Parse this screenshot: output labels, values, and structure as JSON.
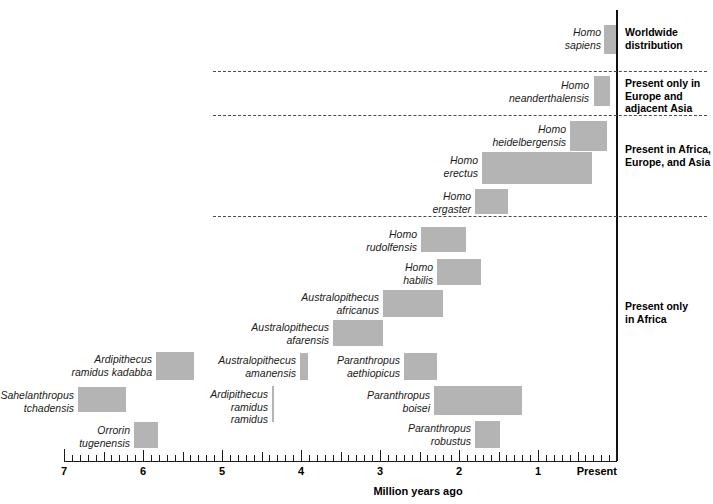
{
  "chart_data": {
    "type": "bar",
    "orientation": "horizontal",
    "title": "",
    "xlabel": "Million years ago",
    "ylabel": "",
    "xlim": [
      7,
      0
    ],
    "x_tick_values": [
      7,
      6,
      5,
      4,
      3,
      2,
      1,
      0
    ],
    "x_tick_labels": [
      "7",
      "6",
      "5",
      "4",
      "3",
      "2",
      "1",
      "Present"
    ],
    "minor_tick_interval": 0.1,
    "grid": false,
    "legend": "none",
    "units": "million years ago",
    "note": "Temporal ranges of hominin species; bar spans give first and last appearance dates in millions of years ago.",
    "categories": [
      "Homo sapiens",
      "Homo neanderthalensis",
      "Homo heidelbergensis",
      "Homo erectus",
      "Homo ergaster",
      "Homo rudolfensis",
      "Homo habilis",
      "Australopithecus africanus",
      "Australopithecus afarensis",
      "Ardipithecus ramidus kadabba",
      "Australopithecus anamensis",
      "Paranthropus aethiopicus",
      "Sahelanthropus tchadensis",
      "Ardipithecus ramidus ramidus",
      "Paranthropus boisei",
      "Orrorin tugenensis",
      "Paranthropus robustus"
    ],
    "ranges": [
      {
        "taxon": "Homo sapiens",
        "start_mya": 0.16,
        "end_mya": 0.0
      },
      {
        "taxon": "Homo neanderthalensis",
        "start_mya": 0.29,
        "end_mya": 0.09
      },
      {
        "taxon": "Homo heidelbergensis",
        "start_mya": 0.6,
        "end_mya": 0.13
      },
      {
        "taxon": "Homo erectus",
        "start_mya": 1.71,
        "end_mya": 0.32
      },
      {
        "taxon": "Homo ergaster",
        "start_mya": 1.8,
        "end_mya": 1.38
      },
      {
        "taxon": "Homo rudolfensis",
        "start_mya": 2.48,
        "end_mya": 1.91
      },
      {
        "taxon": "Homo habilis",
        "start_mya": 2.28,
        "end_mya": 1.72
      },
      {
        "taxon": "Australopithecus africanus",
        "start_mya": 2.96,
        "end_mya": 2.2
      },
      {
        "taxon": "Australopithecus afarensis",
        "start_mya": 3.59,
        "end_mya": 2.96
      },
      {
        "taxon": "Ardipithecus ramidus kadabba",
        "start_mya": 5.84,
        "end_mya": 5.35
      },
      {
        "taxon": "Australopithecus anamensis",
        "start_mya": 4.01,
        "end_mya": 3.91
      },
      {
        "taxon": "Paranthropus aethiopicus",
        "start_mya": 2.7,
        "end_mya": 2.28
      },
      {
        "taxon": "Sahelanthropus tchadensis",
        "start_mya": 6.82,
        "end_mya": 6.21
      },
      {
        "taxon": "Ardipithecus ramidus ramidus",
        "start_mya": 4.37,
        "end_mya": 4.35
      },
      {
        "taxon": "Paranthropus boisei",
        "start_mya": 2.32,
        "end_mya": 1.2
      },
      {
        "taxon": "Orrorin tugenensis",
        "start_mya": 6.11,
        "end_mya": 5.81
      },
      {
        "taxon": "Paranthropus robustus",
        "start_mya": 1.8,
        "end_mya": 1.48
      }
    ],
    "distribution_groups": [
      {
        "label": "Worldwide\ndistribution",
        "taxa": [
          "Homo sapiens"
        ]
      },
      {
        "label": "Present only in\nEurope and\nadjacent Asia",
        "taxa": [
          "Homo neanderthalensis"
        ]
      },
      {
        "label": "Present in Africa,\nEurope, and Asia",
        "taxa": [
          "Homo heidelbergensis",
          "Homo erectus",
          "Homo ergaster"
        ]
      },
      {
        "label": "Present only\nin Africa",
        "taxa": [
          "Homo rudolfensis",
          "Homo habilis",
          "Australopithecus africanus",
          "Australopithecus afarensis",
          "Ardipithecus ramidus kadabba",
          "Australopithecus anamensis",
          "Paranthropus aethiopicus",
          "Sahelanthropus tchadensis",
          "Ardipithecus ramidus ramidus",
          "Paranthropus boisei",
          "Orrorin tugenensis",
          "Paranthropus robustus"
        ]
      }
    ],
    "colors": {
      "bar_fill": "#b4b4b4",
      "axis": "#1a1a1a",
      "divider": "#4b4b4b",
      "present_line": "#111111",
      "background": "#ffffff",
      "text": "#000000"
    }
  },
  "axis": {
    "title": "Million years ago",
    "ticks": [
      {
        "label": "7"
      },
      {
        "label": "6"
      },
      {
        "label": "5"
      },
      {
        "label": "4"
      },
      {
        "label": "3"
      },
      {
        "label": "2"
      },
      {
        "label": "1"
      },
      {
        "label": "Present"
      }
    ]
  },
  "taxa": [
    {
      "name": "Homo\nsapiens"
    },
    {
      "name": "Homo\nneanderthalensis"
    },
    {
      "name": "Homo\nheidelbergensis"
    },
    {
      "name": "Homo\nerectus"
    },
    {
      "name": "Homo\nergaster"
    },
    {
      "name": "Homo\nrudolfensis"
    },
    {
      "name": "Homo\nhabilis"
    },
    {
      "name": "Australopithecus\nafricanus"
    },
    {
      "name": "Australopithecus\nafarensis"
    },
    {
      "name": "Ardipithecus\nramidus kadabba"
    },
    {
      "name": "Australopithecus\namanensis"
    },
    {
      "name": "Paranthropus\naethiopicus"
    },
    {
      "name": "Sahelanthropus\ntchadensis"
    },
    {
      "name": "Ardipithecus\nramidus\nramidus"
    },
    {
      "name": "Paranthropus\nboisei"
    },
    {
      "name": "Orrorin\ntugenensis"
    },
    {
      "name": "Paranthropus\nrobustus"
    }
  ],
  "distribution_captions": [
    {
      "text": "Worldwide\ndistribution"
    },
    {
      "text": "Present only in\nEurope and\nadjacent Asia"
    },
    {
      "text": "Present in Africa,\nEurope, and Asia"
    },
    {
      "text": "Present only\nin Africa"
    }
  ]
}
